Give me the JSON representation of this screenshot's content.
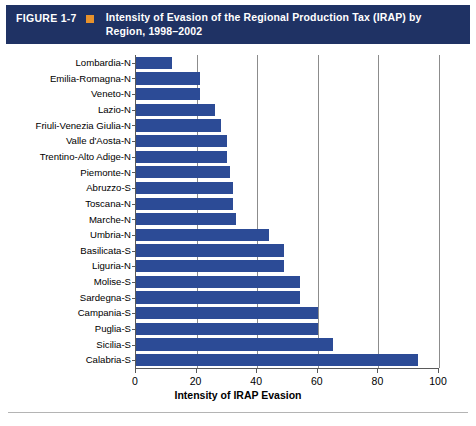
{
  "header": {
    "figure_number": "FIGURE 1-7",
    "bullet_icon": "orange-square-icon",
    "title": "Intensity of Evasion of the Regional Production Tax (IRAP) by Region, 1998–2002",
    "background_color": "#1F3264",
    "bullet_color": "#E8922C",
    "text_color": "#FFFFFF"
  },
  "chart_data": {
    "type": "bar",
    "orientation": "horizontal",
    "title": "Intensity of Evasion of the Regional Production Tax (IRAP) by Region, 1998–2002",
    "xlabel": "Intensity of IRAP Evasion",
    "ylabel": "",
    "xlim": [
      0,
      100
    ],
    "xticks": [
      0,
      20,
      40,
      60,
      80,
      100
    ],
    "xticklabels": [
      "0",
      "20",
      "40",
      "60",
      "80",
      "100"
    ],
    "grid": "vertical",
    "legend": "none",
    "bar_color": "#2C4B96",
    "categories": [
      "Lombardia-N",
      "Emilia-Romagna-N",
      "Veneto-N",
      "Lazio-N",
      "Friuli-Venezia Giulia-N",
      "Valle d'Aosta-N",
      "Trentino-Alto Adige-N",
      "Piemonte-N",
      "Abruzzo-S",
      "Toscana-N",
      "Marche-N",
      "Umbria-N",
      "Basilicata-S",
      "Liguria-N",
      "Molise-S",
      "Sardegna-S",
      "Campania-S",
      "Puglia-S",
      "Sicilia-S",
      "Calabria-S"
    ],
    "values": [
      12,
      21,
      21,
      26,
      28,
      30,
      30,
      31,
      32,
      32,
      33,
      44,
      49,
      49,
      54,
      54,
      60,
      60,
      65,
      93
    ]
  }
}
